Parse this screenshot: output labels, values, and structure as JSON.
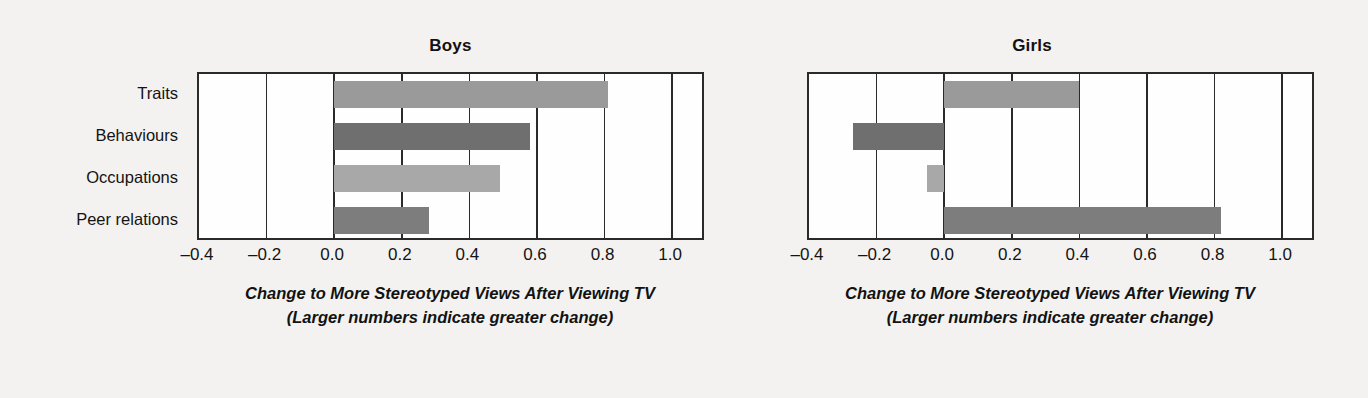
{
  "chart_data": [
    {
      "type": "bar",
      "orientation": "horizontal",
      "title": "Boys",
      "categories": [
        "Traits",
        "Behaviours",
        "Occupations",
        "Peer relations"
      ],
      "values": [
        0.81,
        0.58,
        0.49,
        0.28
      ],
      "bar_colors": [
        "#9a9a9a",
        "#6f6f6f",
        "#a8a8a8",
        "#7d7d7d"
      ],
      "xlabel": "Change to More Stereotyped Views After Viewing TV",
      "xlabel_sub": "(Larger numbers indicate greater change)",
      "ylabel": "",
      "xlim": [
        -0.4,
        1.1
      ],
      "xticks": [
        -0.4,
        -0.2,
        0.0,
        0.2,
        0.4,
        0.6,
        0.8,
        1.0
      ],
      "xticklabels": [
        "–0.4",
        "–0.2",
        "0.0",
        "0.2",
        "0.4",
        "0.6",
        "0.8",
        "1.0"
      ],
      "grid": true,
      "legend": "none"
    },
    {
      "type": "bar",
      "orientation": "horizontal",
      "title": "Girls",
      "categories": [
        "Traits",
        "Behaviours",
        "Occupations",
        "Peer relations"
      ],
      "values": [
        0.4,
        -0.27,
        -0.05,
        0.82
      ],
      "bar_colors": [
        "#9a9a9a",
        "#6f6f6f",
        "#a8a8a8",
        "#7d7d7d"
      ],
      "xlabel": "Change to More Stereotyped Views After Viewing TV",
      "xlabel_sub": "(Larger numbers indicate greater change)",
      "ylabel": "",
      "xlim": [
        -0.4,
        1.1
      ],
      "xticks": [
        -0.4,
        -0.2,
        0.0,
        0.2,
        0.4,
        0.6,
        0.8,
        1.0
      ],
      "xticklabels": [
        "–0.4",
        "–0.2",
        "0.0",
        "0.2",
        "0.4",
        "0.6",
        "0.8",
        "1.0"
      ],
      "grid": true,
      "legend": "none"
    }
  ],
  "panels": {
    "boys": {
      "title": "Boys",
      "caption_line1": "Change to More Stereotyped Views After Viewing TV",
      "caption_line2": "(Larger numbers indicate greater change)"
    },
    "girls": {
      "title": "Girls",
      "caption_line1": "Change to More Stereotyped Views After Viewing TV",
      "caption_line2": "(Larger numbers indicate greater change)"
    }
  },
  "category_labels": [
    "Traits",
    "Behaviours",
    "Occupations",
    "Peer relations"
  ],
  "axis": {
    "ticklabels": [
      "–0.4",
      "–0.2",
      "0.0",
      "0.2",
      "0.4",
      "0.6",
      "0.8",
      "1.0"
    ]
  },
  "colors": {
    "background": "#f3f2f0",
    "plot_background": "#fefefe",
    "axis": "#2a2a2a",
    "bar_traits": "#9a9a9a",
    "bar_behaviours": "#6f6f6f",
    "bar_occupations": "#a8a8a8",
    "bar_peer_relations": "#7d7d7d"
  }
}
